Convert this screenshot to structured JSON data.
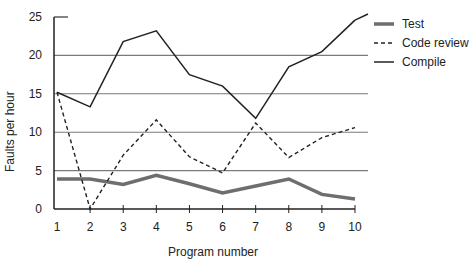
{
  "chart_data": {
    "type": "line",
    "title": "",
    "xlabel": "Program number",
    "ylabel": "Faults per hour",
    "x": [
      1,
      2,
      3,
      4,
      5,
      6,
      7,
      8,
      9,
      10
    ],
    "xticks": [
      "1",
      "2",
      "3",
      "4",
      "5",
      "6",
      "7",
      "8",
      "9",
      "10"
    ],
    "yticks": [
      "0",
      "5",
      "10",
      "15",
      "20",
      "25"
    ],
    "ylim": [
      0,
      25
    ],
    "xlim": [
      1,
      10
    ],
    "grid": "horizontal at 5, 10, 15, 20",
    "legend_position": "upper right, outside plot",
    "series": [
      {
        "name": "Test",
        "style": "thick solid gray",
        "color": "#6e6e6e",
        "values": [
          3.9,
          3.9,
          3.2,
          4.4,
          3.3,
          2.1,
          3.0,
          3.9,
          1.9,
          1.3
        ]
      },
      {
        "name": "Code review",
        "style": "dashed black",
        "color": "#222222",
        "values": [
          15.2,
          0.0,
          7.0,
          11.6,
          6.8,
          4.7,
          11.2,
          6.7,
          9.3,
          10.6
        ]
      },
      {
        "name": "Compile",
        "style": "solid black",
        "color": "#222222",
        "values": [
          15.2,
          13.3,
          21.8,
          23.2,
          17.5,
          16.0,
          11.8,
          18.5,
          20.5,
          24.6
        ]
      }
    ]
  },
  "legend": {
    "items": [
      {
        "label": "Test"
      },
      {
        "label": "Code review"
      },
      {
        "label": "Compile"
      }
    ]
  },
  "axes": {
    "xlabel": "Program number",
    "ylabel": "Faults per hour"
  }
}
